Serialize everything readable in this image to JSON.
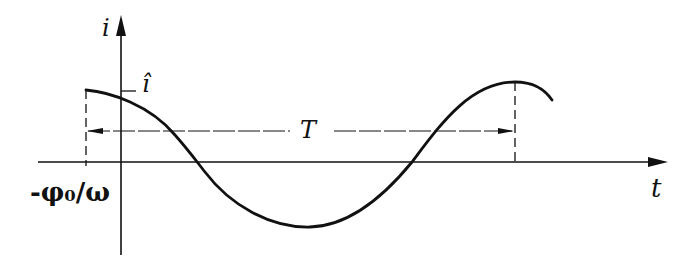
{
  "diagram": {
    "type": "sinusoidal current waveform",
    "labels": {
      "y_axis": "i",
      "x_axis": "t",
      "amplitude": "î",
      "period": "T",
      "phase_offset": "-φ₀/ω"
    },
    "colors": {
      "ink": "#111111",
      "background": "#ffffff"
    }
  }
}
